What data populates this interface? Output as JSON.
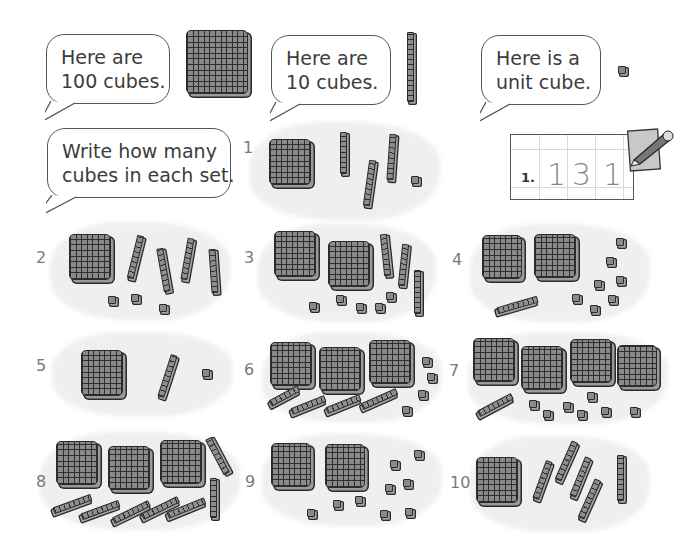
{
  "intro": {
    "bubble_hundred": [
      "Here are",
      "100 cubes."
    ],
    "bubble_ten": [
      "Here are",
      "10 cubes."
    ],
    "bubble_unit": [
      "Here is a",
      "unit cube."
    ],
    "instruction": [
      "Write how many",
      "cubes in each set."
    ]
  },
  "example": {
    "label": "1.",
    "digits": [
      "1",
      "3",
      "1"
    ],
    "icon": "pencil-paper-icon"
  },
  "sets": [
    {
      "number": "1",
      "hundreds": 1,
      "tens": 3,
      "units": 1
    },
    {
      "number": "2",
      "hundreds": 1,
      "tens": 4,
      "units": 3
    },
    {
      "number": "3",
      "hundreds": 2,
      "tens": 3,
      "units": 5
    },
    {
      "number": "4",
      "hundreds": 2,
      "tens": 1,
      "units": 7
    },
    {
      "number": "5",
      "hundreds": 1,
      "tens": 1,
      "units": 1
    },
    {
      "number": "6",
      "hundreds": 3,
      "tens": 4,
      "units": 4
    },
    {
      "number": "7",
      "hundreds": 4,
      "tens": 1,
      "units": 7
    },
    {
      "number": "8",
      "hundreds": 3,
      "tens": 7,
      "units": 0
    },
    {
      "number": "9",
      "hundreds": 2,
      "tens": 0,
      "units": 9
    },
    {
      "number": "10",
      "hundreds": 1,
      "tens": 5,
      "units": 0
    }
  ],
  "colors": {
    "block_fill": "#8a8a8a",
    "block_outline": "#2a2a2a",
    "wash": "#efefef",
    "set_number": "#7a7a7a"
  }
}
